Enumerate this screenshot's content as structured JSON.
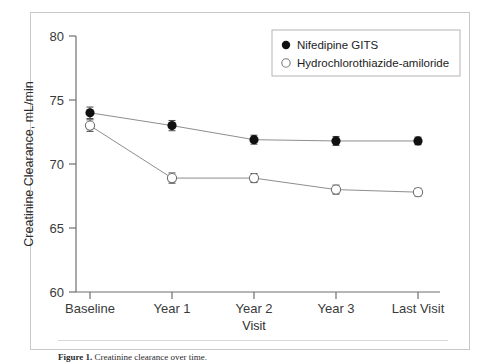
{
  "figure": {
    "caption_label": "Figure 1.",
    "caption_text": "Creatinine clearance over time."
  },
  "chart_data": {
    "type": "line",
    "title": "",
    "xlabel": "Visit",
    "ylabel": "Creatinine Clearance, mL/min",
    "categories": [
      "Baseline",
      "Year 1",
      "Year 2",
      "Year 3",
      "Last Visit"
    ],
    "ylim": [
      60,
      80
    ],
    "yticks": [
      60,
      65,
      70,
      75,
      80
    ],
    "ytick_labels": [
      "60",
      "65",
      "70",
      "75",
      "80"
    ],
    "grid": false,
    "legend_position": "top-right",
    "series": [
      {
        "name": "Nifedipine GITS",
        "marker": "filled-circle",
        "color": "#111111",
        "values": [
          74.0,
          73.0,
          71.9,
          71.8,
          71.8
        ],
        "errors": [
          0.45,
          0.4,
          0.35,
          0.35,
          0.3
        ]
      },
      {
        "name": "Hydrochlorothiazide-amiloride",
        "marker": "open-circle",
        "color": "#888888",
        "values": [
          73.0,
          68.9,
          68.9,
          68.0,
          67.8
        ],
        "errors": [
          0.45,
          0.4,
          0.35,
          0.35,
          0.3
        ]
      }
    ]
  },
  "legend": {
    "entries": [
      {
        "label": "Nifedipine GITS",
        "marker": "filled-circle"
      },
      {
        "label": "Hydrochlorothiazide-amiloride",
        "marker": "open-circle"
      }
    ]
  },
  "axes": {
    "x_title": "Visit",
    "y_title": "Creatinine Clearance, mL/min"
  }
}
